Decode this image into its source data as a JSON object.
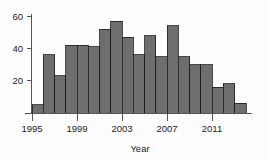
{
  "chart_data": {
    "type": "bar",
    "title": "",
    "subtitle": "",
    "xlabel": "Year",
    "ylabel": "",
    "categories": [
      "1995",
      "1996",
      "1997",
      "1998",
      "1999",
      "2000",
      "2001",
      "2002",
      "2003",
      "2004",
      "2005",
      "2006",
      "2007",
      "2008",
      "2009",
      "2010",
      "2011",
      "2012",
      "2013"
    ],
    "values": [
      5,
      36,
      23,
      42,
      42,
      41,
      52,
      57,
      47,
      36,
      48,
      35,
      54,
      35,
      30,
      30,
      16,
      18,
      6
    ],
    "x_tick_labels": [
      "1995",
      "1999",
      "2003",
      "2007",
      "2011"
    ],
    "x_tick_values": [
      1995,
      1999,
      2003,
      2007,
      2011
    ],
    "y_tick_labels": [
      "20",
      "40",
      "60"
    ],
    "y_tick_values": [
      20,
      40,
      60
    ],
    "xlim": [
      1995,
      2014
    ],
    "ylim": [
      0,
      62
    ],
    "grid": false,
    "legend": false,
    "bar_fill_color": "#6e6e6e",
    "bar_edge_color": "#1c1c1c",
    "axis_color": "#555555",
    "background_color": "#fdfdfd"
  },
  "axis": {
    "x_title": "Year"
  }
}
